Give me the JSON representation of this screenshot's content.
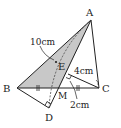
{
  "diagram": {
    "type": "geometry",
    "points": {
      "A": {
        "label": "A",
        "x": 91,
        "y": 20
      },
      "B": {
        "label": "B",
        "x": 17,
        "y": 88
      },
      "C": {
        "label": "C",
        "x": 99,
        "y": 88
      },
      "M": {
        "label": "M",
        "x": 59,
        "y": 88
      },
      "D": {
        "label": "D",
        "x": 49,
        "y": 108
      },
      "E": {
        "label": "E",
        "x": 56,
        "y": 62
      },
      "F": {
        "x": 68,
        "y": 74
      }
    },
    "labels": {
      "A": "A",
      "B": "B",
      "C": "C",
      "D": "D",
      "E": "E",
      "M": "M",
      "len_10": "10cm",
      "len_4": "4cm",
      "len_2": "2cm"
    },
    "colors": {
      "stroke": "#222222",
      "shade": "#c8c8c8",
      "background": "#ffffff"
    }
  }
}
